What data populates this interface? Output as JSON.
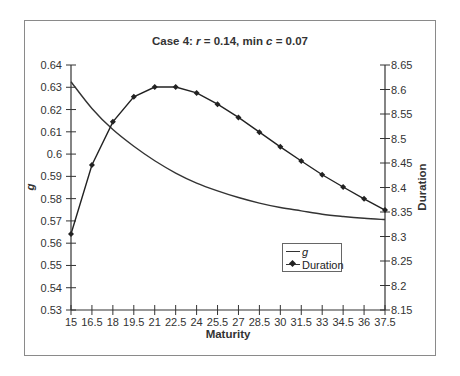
{
  "chart_data": {
    "type": "line",
    "title": "Case 4:   r = 0.14,  min c = 0.07",
    "title_parts": {
      "prefix": "Case 4:   ",
      "r_var": "r",
      "r_text": " = 0.14,  min ",
      "c_var": "c",
      "c_text": " = 0.07"
    },
    "xlabel": "Maturity",
    "ylabel": "g",
    "y2label": "Duration",
    "x": [
      15,
      16.5,
      18,
      19.5,
      21,
      22.5,
      24,
      25.5,
      27,
      28.5,
      30,
      31.5,
      33,
      34.5,
      36,
      37.5
    ],
    "x_tick_labels": [
      "15",
      "16.5",
      "18",
      "19.5",
      "21",
      "22.5",
      "24",
      "25.5",
      "27",
      "28.5",
      "30",
      "31.5",
      "33",
      "34.5",
      "36",
      "37.5"
    ],
    "ylim": [
      0.53,
      0.64
    ],
    "y_tick_labels": [
      "0.64",
      "0.63",
      "0.62",
      "0.61",
      "0.6",
      "0.59",
      "0.58",
      "0.57",
      "0.56",
      "0.55",
      "0.54",
      "0.53"
    ],
    "y2lim": [
      8.15,
      8.65
    ],
    "y2_tick_labels": [
      "8.65",
      "8.6",
      "8.55",
      "8.5",
      "8.45",
      "8.4",
      "8.35",
      "8.3",
      "8.25",
      "8.2",
      "8.15"
    ],
    "grid": false,
    "legend_position": "lower right inside plot",
    "series": [
      {
        "name": "g",
        "axis": "left",
        "marker": "none",
        "values": [
          0.6325,
          0.6205,
          0.611,
          0.6035,
          0.597,
          0.5915,
          0.587,
          0.5835,
          0.5805,
          0.578,
          0.576,
          0.5745,
          0.573,
          0.572,
          0.5712,
          0.5706
        ]
      },
      {
        "name": "Duration",
        "axis": "right",
        "marker": "diamond",
        "values": [
          8.305,
          8.446,
          8.534,
          8.585,
          8.605,
          8.605,
          8.593,
          8.57,
          8.543,
          8.513,
          8.483,
          8.454,
          8.426,
          8.401,
          8.377,
          8.354
        ]
      }
    ]
  },
  "legend": {
    "g_label": "g",
    "duration_label": "Duration"
  }
}
